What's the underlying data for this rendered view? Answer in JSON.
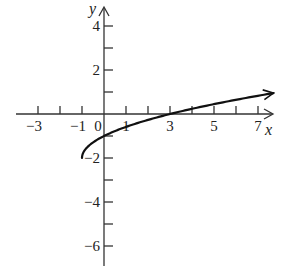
{
  "chart_data": {
    "type": "line",
    "title": "",
    "function": "y = sqrt(x + 1) - 2",
    "xlabel": "x",
    "ylabel": "y",
    "xlim": [
      -4,
      8
    ],
    "ylim": [
      -7,
      5
    ],
    "grid": false,
    "legend": null,
    "x_tick_positions": [
      -3,
      -2,
      -1,
      0,
      1,
      2,
      3,
      4,
      5,
      6,
      7
    ],
    "x_tick_labels": [
      {
        "value": -3,
        "label": "−3"
      },
      {
        "value": -1,
        "label": "−1"
      },
      {
        "value": 0,
        "label": "0"
      },
      {
        "value": 1,
        "label": "1"
      },
      {
        "value": 3,
        "label": "3"
      },
      {
        "value": 5,
        "label": "5"
      },
      {
        "value": 7,
        "label": "7"
      }
    ],
    "y_tick_positions": [
      4,
      3,
      2,
      1,
      -1,
      -2,
      -3,
      -4,
      -5,
      -6
    ],
    "y_tick_labels": [
      {
        "value": 4,
        "label": "4"
      },
      {
        "value": 2,
        "label": "2"
      },
      {
        "value": -2,
        "label": "−2"
      },
      {
        "value": -4,
        "label": "−4"
      },
      {
        "value": -6,
        "label": "−6"
      }
    ],
    "series": [
      {
        "name": "y = sqrt(x+1) - 2",
        "start_point": {
          "x": -1,
          "y": -2
        },
        "arrow_end": true,
        "x": [
          -1,
          -0.75,
          -0.5,
          0,
          1,
          2,
          3,
          4,
          5,
          6,
          7,
          7.7
        ],
        "y": [
          -2,
          -1.5,
          -1.29,
          -1,
          -0.59,
          -0.27,
          0,
          0.24,
          0.45,
          0.65,
          0.83,
          0.95
        ]
      }
    ],
    "key_points": [
      {
        "x": -1,
        "y": -2,
        "note": "starting point"
      },
      {
        "x": 0,
        "y": -1,
        "note": "y-intercept"
      },
      {
        "x": 3,
        "y": 0,
        "note": "x-intercept"
      }
    ]
  },
  "axes": {
    "x_name": "x",
    "y_name": "y"
  }
}
